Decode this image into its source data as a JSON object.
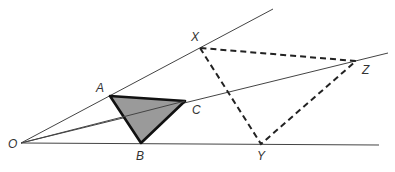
{
  "diagram": {
    "centre": {
      "label": "O",
      "x": 21,
      "y": 143,
      "label_x": 8,
      "label_y": 148
    },
    "rays": [
      {
        "name": "ray-OX",
        "from": "O",
        "to_x": 273,
        "to_y": 9
      },
      {
        "name": "ray-OZ",
        "from": "O",
        "to_x": 388,
        "to_y": 53
      },
      {
        "name": "ray-OY",
        "from": "O",
        "to_x": 379,
        "to_y": 145
      }
    ],
    "object_triangle": {
      "style": "solid-shaded",
      "fill": "#9a9a9a",
      "vertices": [
        {
          "label": "A",
          "x": 110,
          "y": 96,
          "label_x": 96,
          "label_y": 92
        },
        {
          "label": "B",
          "x": 141,
          "y": 143,
          "label_x": 136,
          "label_y": 160
        },
        {
          "label": "C",
          "x": 185,
          "y": 101,
          "label_x": 192,
          "label_y": 114
        }
      ]
    },
    "image_triangle": {
      "style": "dashed",
      "vertices": [
        {
          "label": "X",
          "x": 200,
          "y": 48,
          "label_x": 191,
          "label_y": 41
        },
        {
          "label": "Y",
          "x": 261,
          "y": 144,
          "label_x": 257,
          "label_y": 160
        },
        {
          "label": "Z",
          "x": 356,
          "y": 61,
          "label_x": 362,
          "label_y": 74
        }
      ]
    }
  }
}
